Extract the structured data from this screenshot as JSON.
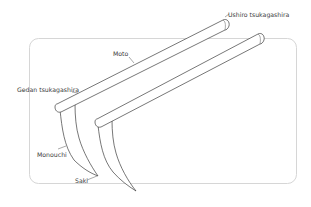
{
  "diagram": {
    "colors": {
      "outline": "#3c3c3c",
      "frame": "#d6d6d6",
      "text": "#3a3a3a",
      "background": "#ffffff"
    },
    "labels": {
      "ushiro_tsukagashira": "Ushiro tsukagashira",
      "moto": "Moto",
      "gedan_tsukagashira": "Gedan tsukagashira",
      "monouchi": "Monouchi",
      "saki": "Saki"
    }
  }
}
